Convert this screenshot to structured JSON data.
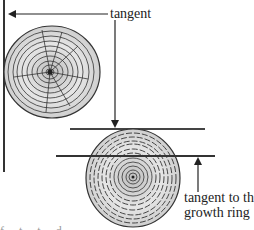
{
  "labels": {
    "tangent": "tangent",
    "tangent_to_growth_ring_line1": "tangent to the",
    "tangent_to_growth_ring_line2": "growth ring"
  },
  "caption_fragment": "f   t  t  d",
  "colors": {
    "ink": "#222222",
    "wood_fill": "#d9d9d9",
    "wood_light": "#ececec",
    "background": "#ffffff"
  }
}
